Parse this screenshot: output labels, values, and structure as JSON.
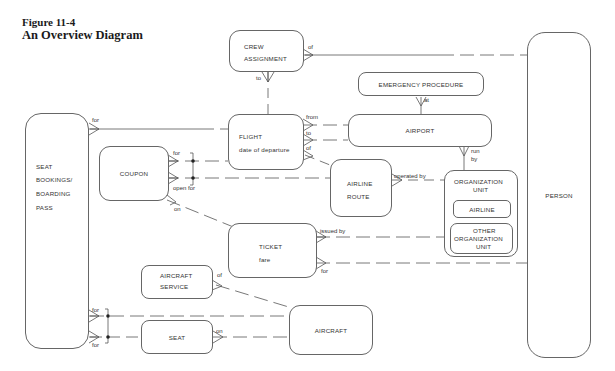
{
  "figure": {
    "number": "Figure 11-4",
    "title": "An Overview Diagram"
  },
  "entities": {
    "crew_assignment": [
      "CREW",
      "ASSIGNMENT"
    ],
    "emergency_procedure": "EMERGENCY PROCEDURE",
    "flight": [
      "FLIGHT",
      "date of departure"
    ],
    "airport": "AIRPORT",
    "seat_bookings": [
      "SEAT",
      "BOOKINGS/",
      "BOARDING",
      "PASS"
    ],
    "coupon": "COUPON",
    "airline_route": [
      "AIRLINE",
      "ROUTE"
    ],
    "organization_unit": [
      "ORGANIZATION",
      "UNIT"
    ],
    "airline": "AIRLINE",
    "other_organization_unit": [
      "OTHER",
      "ORGANIZATION",
      "UNIT"
    ],
    "person": "PERSON",
    "ticket": [
      "TICKET",
      "fare"
    ],
    "aircraft_service": [
      "AIRCRAFT",
      "SERVICE"
    ],
    "seat": "SEAT",
    "aircraft": "AIRCRAFT"
  },
  "relationships": {
    "crew_of": "of",
    "crew_to": "to",
    "emergency_at": "at",
    "seat_bookings_for": "for",
    "flight_from": "from",
    "flight_to": "to",
    "flight_of": "of",
    "airport_run_by": [
      "run",
      "by"
    ],
    "coupon_for": "for",
    "coupon_open_for": "open for",
    "coupon_on": "on",
    "route_operated_by": "operated by",
    "ticket_issued_by": "issued by",
    "ticket_for": "for",
    "service_of": "of",
    "bookings_for_aircraft": "for",
    "bookings_for_seat": "for",
    "seat_on": "on"
  }
}
